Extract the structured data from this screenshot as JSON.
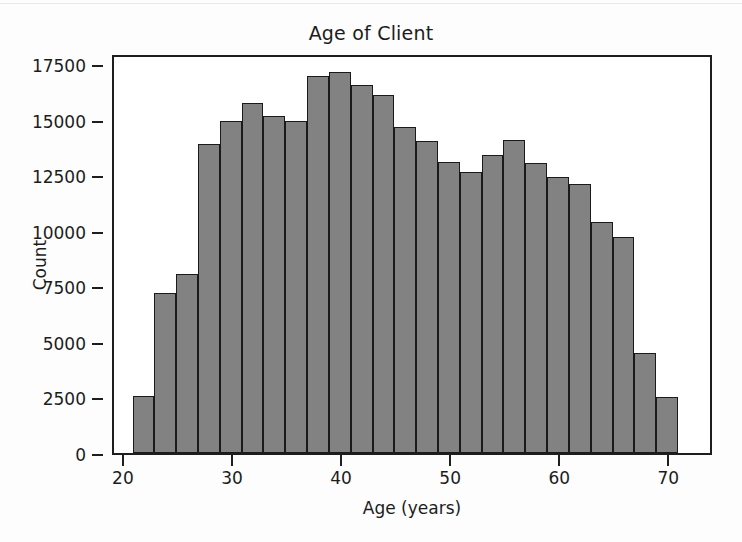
{
  "chart_data": {
    "type": "bar",
    "title": "Age of Client",
    "xlabel": "Age (years)",
    "ylabel": "Count",
    "xlim": [
      19.0,
      74.0
    ],
    "ylim": [
      0,
      18000
    ],
    "grid": false,
    "legend": null,
    "bin_width": 2,
    "bin_starts": [
      20.7,
      22.7,
      24.7,
      26.7,
      28.7,
      30.7,
      32.7,
      34.7,
      36.7,
      38.7,
      40.7,
      42.7,
      44.7,
      46.7,
      48.7,
      50.7,
      52.7,
      54.7,
      56.7,
      58.7,
      60.7,
      62.7,
      64.7,
      66.7
    ],
    "categories": [
      "20.7-22.7",
      "22.7-24.7",
      "24.7-26.7",
      "26.7-28.7",
      "28.7-30.7",
      "30.7-32.7",
      "32.7-34.7",
      "34.7-36.7",
      "36.7-38.7",
      "38.7-40.7",
      "40.7-42.7",
      "42.7-44.7",
      "44.7-46.7",
      "46.7-48.7",
      "48.7-50.7",
      "50.7-52.7",
      "52.7-54.7",
      "54.7-56.7",
      "56.7-58.7",
      "58.7-60.7",
      "60.7-62.7",
      "62.7-64.7",
      "64.7-66.7",
      "66.7-68.7"
    ],
    "values": [
      2560,
      7200,
      8050,
      13900,
      14950,
      15750,
      15150,
      14950,
      16950,
      17150,
      16550,
      16100,
      14650,
      14050,
      13100,
      12650,
      13400,
      14100,
      13050,
      12400,
      12100,
      10400,
      9700,
      4500
    ],
    "last_bar_value": 2500,
    "xticks": [
      20,
      30,
      40,
      50,
      60,
      70
    ],
    "xticklabels": [
      "20",
      "30",
      "40",
      "50",
      "60",
      "70"
    ],
    "yticks": [
      0,
      2500,
      5000,
      7500,
      10000,
      12500,
      15000,
      17500
    ],
    "yticklabels": [
      "0",
      "2500",
      "5000",
      "7500",
      "10000",
      "12500",
      "15000",
      "17500"
    ],
    "bar_fill_color": "#828282",
    "bar_edge_color": "#1a1a1a",
    "background_color": "#ffffff"
  }
}
